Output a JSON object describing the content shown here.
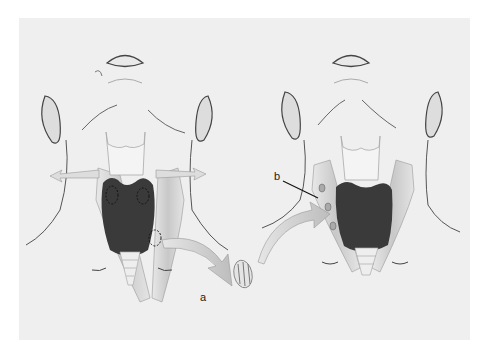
{
  "figure": {
    "labels": {
      "a": "a",
      "b": "b"
    },
    "colors": {
      "background": "#efefef",
      "thyroid": "#3a3a3a",
      "cartilage": "#f2f2f2",
      "muscle": "#d4d4d4",
      "arrow": "#cfcfcf",
      "outline": "#555555"
    }
  }
}
